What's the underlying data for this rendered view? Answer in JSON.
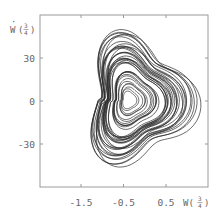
{
  "chart_data": {
    "type": "line",
    "subtype": "phase-portrait",
    "title": "",
    "xlabel": "W(3/4)",
    "ylabel": "Ẇ(3/4)",
    "xlabel_parts": {
      "base": "W(",
      "num": "3",
      "den": "4",
      "close": ")"
    },
    "ylabel_parts": {
      "base": "W",
      "dot": true,
      "num": "3",
      "den": "4",
      "close": ")"
    },
    "x_ticks": [
      -1.5,
      -0.5,
      0.5
    ],
    "x_tick_labels": [
      "-1.5",
      "-0.5",
      "0.5"
    ],
    "y_ticks": [
      30,
      0,
      -30
    ],
    "y_tick_labels": [
      "30",
      "0",
      "-30"
    ],
    "xlim": [
      -2.3,
      1.0
    ],
    "ylim": [
      -62,
      66
    ],
    "grid": false,
    "legend": null,
    "series": [
      {
        "name": "trajectory",
        "color": "#333333",
        "center": [
          -0.45,
          -1
        ],
        "outer_extent": {
          "w_min": -1.65,
          "w_max": 0.88,
          "wdot_min": -42,
          "wdot_max": 40
        },
        "approx_loops": 38
      }
    ]
  },
  "colors": {
    "frame": "#999999",
    "curve": "#2b2b2b",
    "text": "#666666",
    "background": "#ffffff"
  }
}
